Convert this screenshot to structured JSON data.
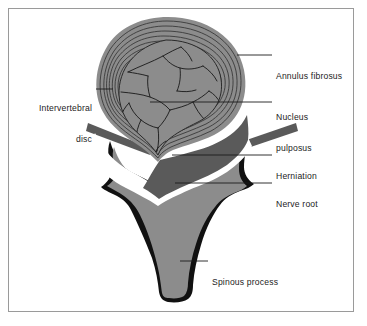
{
  "figure": {
    "type": "anatomical-diagram",
    "background_color": "#ffffff",
    "frame_color": "#9a9a9a",
    "palette": {
      "mid_gray": "#8c8c8c",
      "dark_gray": "#5a5a5a",
      "outline_black": "#111111",
      "nerve_white": "#ffffff",
      "ring_line": "#3a3a3a",
      "leader_line": "#1c1c1c",
      "text": "#1c1c1c"
    }
  },
  "labels": [
    {
      "id": "annulus-fibrosus",
      "lines": [
        "Annulus fibrosus"
      ],
      "side": "right",
      "text_x": 276,
      "text_y": 50,
      "leader": {
        "x1": 237,
        "y1": 55,
        "x2": 272,
        "y2": 55
      }
    },
    {
      "id": "nucleus-pulposus",
      "lines": [
        "Nucleus",
        "pulposus"
      ],
      "side": "right",
      "text_x": 276,
      "text_y": 91,
      "leader": {
        "x1": 150,
        "y1": 102,
        "x2": 272,
        "y2": 102
      }
    },
    {
      "id": "intervertebral-disc",
      "lines": [
        "Intervertebral",
        "disc"
      ],
      "side": "left",
      "text_x": 22,
      "text_y": 82,
      "text_width": 70,
      "leader": {
        "x1": 96,
        "y1": 89,
        "x2": 113,
        "y2": 89
      }
    },
    {
      "id": "herniation",
      "lines": [
        "Herniation"
      ],
      "side": "right",
      "text_x": 276,
      "text_y": 150,
      "leader": {
        "x1": 172,
        "y1": 155,
        "x2": 272,
        "y2": 155
      }
    },
    {
      "id": "nerve-root",
      "lines": [
        "Nerve root"
      ],
      "side": "right",
      "text_x": 276,
      "text_y": 178,
      "leader": {
        "x1": 175,
        "y1": 183,
        "x2": 272,
        "y2": 183
      }
    },
    {
      "id": "spinous-process",
      "lines": [
        "Spinous process"
      ],
      "side": "right",
      "text_x": 212,
      "text_y": 256,
      "leader": {
        "x1": 180,
        "y1": 261,
        "x2": 208,
        "y2": 261
      }
    }
  ],
  "structures": [
    {
      "id": "annulus-fibrosus",
      "description": "Concentric fibrous rings forming outer wall of the disc",
      "fill": "#8c8c8c",
      "ring_count": 7
    },
    {
      "id": "nucleus-pulposus",
      "description": "Inner gel core with fissure lines, extruded posteriorly",
      "fill": "#8c8c8c"
    },
    {
      "id": "herniation",
      "description": "Posterior protrusion of disc material compressing the canal",
      "fill": "#5a5a5a"
    },
    {
      "id": "nerve-root",
      "description": "White band of neural tissue within the vertebral canal",
      "fill": "#ffffff"
    },
    {
      "id": "vertebral-body",
      "description": "Gray body of the vertebra with black cortical outline",
      "fill": "#8c8c8c"
    },
    {
      "id": "spinous-process",
      "description": "Posterior bony projection with rounded black tip",
      "fill": "#8c8c8c"
    },
    {
      "id": "transverse-process-left",
      "description": "Left lateral bony wing",
      "fill": "#8c8c8c"
    },
    {
      "id": "transverse-process-right",
      "description": "Right lateral bony wing",
      "fill": "#8c8c8c"
    }
  ]
}
